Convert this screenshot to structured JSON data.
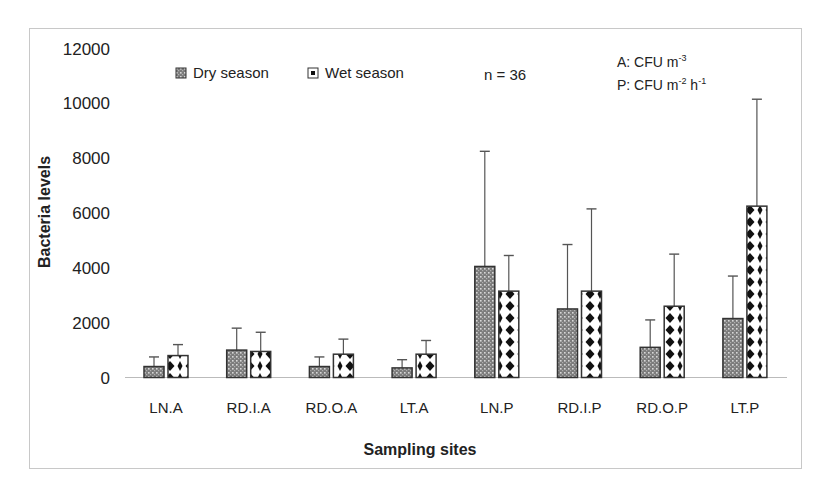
{
  "chart_data": {
    "type": "bar",
    "title": "",
    "xlabel": "Sampling sites",
    "ylabel": "Bacteria levels",
    "ylim": [
      0,
      12000
    ],
    "yticks": [
      0,
      2000,
      4000,
      6000,
      8000,
      10000,
      12000
    ],
    "grid": false,
    "legend_position": "top-left inside",
    "categories": [
      "LN.A",
      "RD.I.A",
      "RD.O.A",
      "LT.A",
      "LN.P",
      "RD.I.P",
      "RD.O.P",
      "LT.P"
    ],
    "series": [
      {
        "name": "Dry season",
        "pattern": "dense-dots",
        "values": [
          400,
          1000,
          400,
          350,
          4050,
          2500,
          1100,
          2150
        ],
        "error_upper": [
          750,
          1800,
          750,
          650,
          8250,
          4850,
          2100,
          3700
        ]
      },
      {
        "name": "Wet season",
        "pattern": "diamond-dots",
        "values": [
          800,
          950,
          850,
          850,
          3150,
          3150,
          2600,
          6250
        ],
        "error_upper": [
          1200,
          1650,
          1400,
          1350,
          4450,
          6150,
          4500,
          10150
        ]
      }
    ],
    "annotations": {
      "n": "n = 36",
      "unit_a_prefix": "A: CFU m",
      "unit_a_sup": "-3",
      "unit_p_prefix": "P: CFU m",
      "unit_p_sup1": "-2",
      "unit_p_mid": " h",
      "unit_p_sup2": "-1"
    }
  },
  "colors": {
    "bar_outline": "#333333",
    "dry_fill": "#8a8a8a",
    "wet_fill": "#ffffff",
    "wet_dot": "#111111",
    "error_bar": "#555555",
    "axis": "#bbbbbb",
    "frame": "#c8c8c8"
  }
}
